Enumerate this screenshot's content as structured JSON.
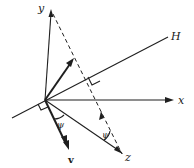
{
  "diagram": {
    "labels": {
      "y": "y",
      "x": "x",
      "H": "H",
      "v": "v",
      "z": "z",
      "psi_near_v": "ψ",
      "psi_near_z": "ψ"
    },
    "colors": {
      "stroke": "#1f1f1f",
      "background": "#ffffff"
    }
  }
}
